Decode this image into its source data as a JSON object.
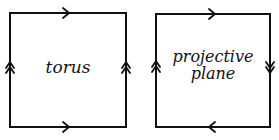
{
  "diagrams": [
    {
      "name": "torus",
      "label": "torus",
      "edges": {
        "top": {
          "arrow": "single",
          "direction": "right"
        },
        "bottom": {
          "arrow": "single",
          "direction": "right"
        },
        "left": {
          "arrow": "double",
          "direction": "up"
        },
        "right": {
          "arrow": "double",
          "direction": "up"
        }
      }
    },
    {
      "name": "projective-plane",
      "label_line1": "projective",
      "label_line2": "plane",
      "edges": {
        "top": {
          "arrow": "single",
          "direction": "right"
        },
        "bottom": {
          "arrow": "single",
          "direction": "left"
        },
        "left": {
          "arrow": "double",
          "direction": "up"
        },
        "right": {
          "arrow": "double",
          "direction": "down"
        }
      }
    }
  ]
}
